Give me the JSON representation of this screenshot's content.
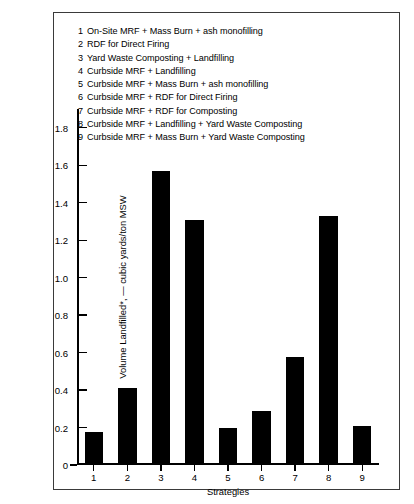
{
  "chart_data": {
    "type": "bar",
    "title": "",
    "xlabel": "Strategies",
    "ylabel": "Volume Landfilled*, — cubic yards/ton MSW",
    "categories": [
      "1",
      "2",
      "3",
      "4",
      "5",
      "6",
      "7",
      "8",
      "9"
    ],
    "values": [
      0.17,
      0.4,
      1.56,
      1.3,
      0.19,
      0.28,
      0.57,
      1.32,
      0.2
    ],
    "ylim": [
      0,
      1.9
    ],
    "ytick_values": [
      0,
      0.2,
      0.4,
      0.6,
      0.8,
      1.0,
      1.2,
      1.4,
      1.6,
      1.8
    ],
    "ytick_labels": [
      "0",
      "0.2",
      "0.4",
      "0.6",
      "0.8",
      "1.0",
      "1.2",
      "1.4",
      "1.6",
      "1.8"
    ],
    "grid": false,
    "legend_position": "top-inside",
    "bar_color": "#000000",
    "frame_color": "#3a3a3a",
    "legend": [
      {
        "num": "1",
        "label": "On-Site MRF + Mass Burn + ash monofilling"
      },
      {
        "num": "2",
        "label": "RDF for Direct Firing"
      },
      {
        "num": "3",
        "label": "Yard Waste Composting + Landfilling"
      },
      {
        "num": "4",
        "label": "Curbside MRF + Landfilling"
      },
      {
        "num": "5",
        "label": "Curbside MRF + Mass Burn + ash monofilling"
      },
      {
        "num": "6",
        "label": "Curbside MRF + RDF for Direct Firing"
      },
      {
        "num": "7",
        "label": "Curbside MRF + RDF for Composting"
      },
      {
        "num": "8",
        "label": "Curbside MRF + Landfilling + Yard Waste Composting"
      },
      {
        "num": "9",
        "label": "Curbside MRF + Mass Burn + Yard Waste Composting"
      }
    ]
  }
}
